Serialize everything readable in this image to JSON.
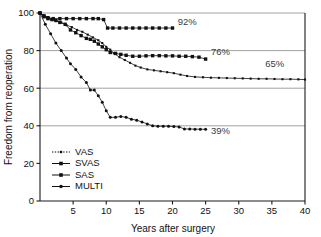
{
  "chart_data": {
    "type": "line",
    "title": "",
    "xlabel": "Years after surgery",
    "ylabel": "Freedom from reoperation",
    "xlim": [
      0,
      40
    ],
    "ylim": [
      0,
      100
    ],
    "xticks": [
      5,
      10,
      15,
      20,
      25,
      30,
      35,
      40
    ],
    "yticks": [
      0,
      20,
      40,
      60,
      80,
      100
    ],
    "grid": "horizontal gridlines at 40, 60, 80, 100",
    "legend_position": "lower-left inside axes",
    "series": [
      {
        "name": "VAS",
        "marker": "small-square",
        "line": "dotted",
        "endpoint_label": "65%",
        "points": [
          [
            0,
            100
          ],
          [
            0.6,
            98.5
          ],
          [
            1.2,
            97.5
          ],
          [
            1.8,
            96.5
          ],
          [
            2.4,
            96
          ],
          [
            3.2,
            95
          ],
          [
            4.0,
            93.5
          ],
          [
            4.8,
            92.5
          ],
          [
            5.6,
            91
          ],
          [
            6.4,
            90
          ],
          [
            7.2,
            88.5
          ],
          [
            8.0,
            87
          ],
          [
            8.8,
            85.5
          ],
          [
            9.4,
            84
          ],
          [
            10.0,
            82
          ],
          [
            10.6,
            80.5
          ],
          [
            11.2,
            78.5
          ],
          [
            12.0,
            76.5
          ],
          [
            12.8,
            75
          ],
          [
            13.6,
            73.5
          ],
          [
            14.4,
            72
          ],
          [
            15.2,
            71
          ],
          [
            16.2,
            70
          ],
          [
            17.2,
            69.5
          ],
          [
            18.2,
            69
          ],
          [
            19.2,
            68.5
          ],
          [
            20.2,
            68
          ],
          [
            21.2,
            67.2
          ],
          [
            22.2,
            66.5
          ],
          [
            23.4,
            66
          ],
          [
            24.6,
            65.8
          ],
          [
            25.8,
            65.6
          ],
          [
            27.0,
            65.5
          ],
          [
            28.2,
            65.4
          ],
          [
            29.4,
            65.3
          ],
          [
            30.6,
            65.2
          ],
          [
            31.8,
            65.1
          ],
          [
            33.0,
            65.0
          ],
          [
            34.2,
            65.0
          ],
          [
            35.4,
            64.9
          ],
          [
            36.6,
            64.8
          ],
          [
            37.8,
            64.8
          ],
          [
            39.0,
            64.7
          ],
          [
            40.0,
            64.6
          ]
        ]
      },
      {
        "name": "SVAS",
        "marker": "square",
        "line": "solid",
        "endpoint_label": "92%",
        "points": [
          [
            0,
            100
          ],
          [
            0.6,
            98.5
          ],
          [
            1.2,
            97.5
          ],
          [
            2.0,
            97
          ],
          [
            3.0,
            97
          ],
          [
            4.0,
            97
          ],
          [
            5.0,
            97
          ],
          [
            6.0,
            97
          ],
          [
            7.0,
            97
          ],
          [
            8.0,
            97
          ],
          [
            8.8,
            97
          ],
          [
            9.6,
            96.5
          ],
          [
            10.2,
            92
          ],
          [
            11.0,
            92
          ],
          [
            12.0,
            92
          ],
          [
            13.0,
            92
          ],
          [
            14.0,
            92
          ],
          [
            15.0,
            92
          ],
          [
            16.0,
            92
          ],
          [
            17.0,
            92
          ],
          [
            18.0,
            92
          ],
          [
            19.0,
            92
          ],
          [
            20.0,
            92
          ]
        ]
      },
      {
        "name": "SAS",
        "marker": "square",
        "line": "solid",
        "endpoint_label": "76%",
        "points": [
          [
            0,
            100
          ],
          [
            0.6,
            98
          ],
          [
            1.2,
            97
          ],
          [
            1.8,
            96.5
          ],
          [
            2.4,
            96
          ],
          [
            3.0,
            95
          ],
          [
            3.8,
            94
          ],
          [
            4.6,
            91
          ],
          [
            5.4,
            89.5
          ],
          [
            6.2,
            88
          ],
          [
            7.0,
            86.5
          ],
          [
            7.6,
            86
          ],
          [
            8.2,
            85
          ],
          [
            8.8,
            83.5
          ],
          [
            9.4,
            82
          ],
          [
            10.0,
            80.5
          ],
          [
            10.6,
            79
          ],
          [
            11.4,
            78.5
          ],
          [
            12.2,
            78
          ],
          [
            13.0,
            77.5
          ],
          [
            14.0,
            77
          ],
          [
            15.0,
            77
          ],
          [
            16.0,
            77.2
          ],
          [
            17.0,
            77.3
          ],
          [
            18.0,
            77.3
          ],
          [
            19.0,
            77.2
          ],
          [
            20.0,
            77.2
          ],
          [
            21.0,
            77.0
          ],
          [
            22.0,
            77.0
          ],
          [
            23.0,
            76.8
          ],
          [
            24.0,
            76.5
          ],
          [
            25.0,
            75.5
          ]
        ]
      },
      {
        "name": "MULTI",
        "marker": "dot",
        "line": "solid",
        "endpoint_label": "39%",
        "points": [
          [
            0,
            100
          ],
          [
            0.8,
            94
          ],
          [
            1.6,
            89
          ],
          [
            2.4,
            84
          ],
          [
            3.2,
            80
          ],
          [
            4.0,
            76
          ],
          [
            4.6,
            73
          ],
          [
            5.4,
            70
          ],
          [
            6.2,
            66
          ],
          [
            7.0,
            63
          ],
          [
            7.6,
            59
          ],
          [
            8.2,
            59
          ],
          [
            8.8,
            56
          ],
          [
            9.4,
            52.5
          ],
          [
            10.0,
            48
          ],
          [
            10.6,
            44.5
          ],
          [
            11.4,
            44.5
          ],
          [
            12.2,
            45
          ],
          [
            13.0,
            44.5
          ],
          [
            13.8,
            43.5
          ],
          [
            14.6,
            43
          ],
          [
            15.4,
            42
          ],
          [
            16.2,
            41
          ],
          [
            17.0,
            40
          ],
          [
            17.8,
            39.8
          ],
          [
            18.6,
            39.8
          ],
          [
            19.4,
            39.8
          ],
          [
            20.2,
            39.6
          ],
          [
            21.0,
            39.4
          ],
          [
            21.8,
            38.3
          ],
          [
            22.6,
            38.3
          ],
          [
            23.4,
            38.2
          ],
          [
            24.2,
            38.2
          ],
          [
            25.0,
            38.1
          ]
        ]
      }
    ],
    "annotations": [
      {
        "text": "92%",
        "x": 20.8,
        "y": 93.5
      },
      {
        "text": "76%",
        "x": 25.8,
        "y": 77.5
      },
      {
        "text": "65%",
        "x": 34.0,
        "y": 71.5
      },
      {
        "text": "39%",
        "x": 25.8,
        "y": 35.5
      }
    ]
  },
  "legend": {
    "items": [
      {
        "label": "VAS"
      },
      {
        "label": "SVAS"
      },
      {
        "label": "SAS"
      },
      {
        "label": "MULTI"
      }
    ]
  },
  "colors": {
    "ink": "#111111",
    "grid": "#8a8a8a",
    "annotation": "#3a3a3a",
    "background": "#ffffff"
  }
}
